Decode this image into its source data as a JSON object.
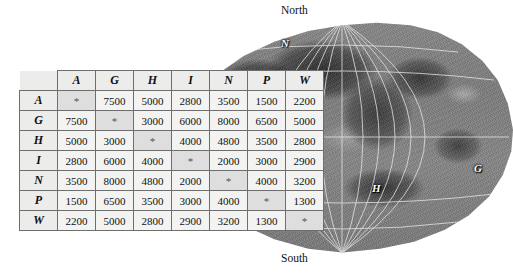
{
  "figure": {
    "title": "",
    "map": {
      "pole_north_label": "North",
      "pole_south_label": "South",
      "node_labels": [
        {
          "id": "N",
          "x": 281,
          "y": 38
        },
        {
          "id": "I",
          "x": 299,
          "y": 84
        },
        {
          "id": "A",
          "x": 259,
          "y": 124
        },
        {
          "id": "W",
          "x": 306,
          "y": 148
        },
        {
          "id": "P",
          "x": 270,
          "y": 166
        },
        {
          "id": "H",
          "x": 372,
          "y": 183
        },
        {
          "id": "G",
          "x": 474,
          "y": 163
        }
      ]
    }
  },
  "chart_data": {
    "type": "table",
    "title": "",
    "xlabel": "",
    "ylabel": "",
    "corner_label": "",
    "diagonal_symbol": "*",
    "categories": [
      "A",
      "G",
      "H",
      "I",
      "N",
      "P",
      "W"
    ],
    "row_headers": [
      "A",
      "G",
      "H",
      "I",
      "N",
      "P",
      "W"
    ],
    "column_headers": [
      "A",
      "G",
      "H",
      "I",
      "N",
      "P",
      "W"
    ],
    "rows": [
      {
        "label": "A",
        "values": [
          "*",
          "7500",
          "5000",
          "2800",
          "3500",
          "1500",
          "2200"
        ]
      },
      {
        "label": "G",
        "values": [
          "7500",
          "*",
          "3000",
          "6000",
          "8000",
          "6500",
          "5000"
        ]
      },
      {
        "label": "H",
        "values": [
          "5000",
          "3000",
          "*",
          "4000",
          "4800",
          "3500",
          "2800"
        ]
      },
      {
        "label": "I",
        "values": [
          "2800",
          "6000",
          "4000",
          "*",
          "2000",
          "3000",
          "2900"
        ]
      },
      {
        "label": "N",
        "values": [
          "3500",
          "8000",
          "4800",
          "2000",
          "*",
          "4000",
          "3200"
        ]
      },
      {
        "label": "P",
        "values": [
          "1500",
          "6500",
          "3500",
          "3000",
          "4000",
          "*",
          "1300"
        ]
      },
      {
        "label": "W",
        "values": [
          "2200",
          "5000",
          "2800",
          "2900",
          "3200",
          "1300",
          "*"
        ]
      }
    ]
  }
}
